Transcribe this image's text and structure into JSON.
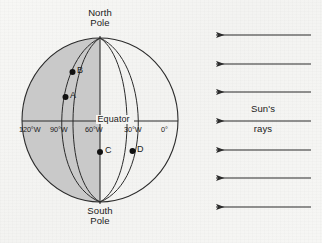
{
  "figure": {
    "type": "earth-day-night-diagram"
  },
  "globe": {
    "poles": {
      "north": {
        "line1": "North",
        "line2": "Pole"
      },
      "south": {
        "line1": "South",
        "line2": "Pole"
      }
    },
    "equator_label": "Equator",
    "shaded_half": "west",
    "shade_color": "#c9c9c9",
    "outline_color": "#2b2b2b",
    "meridians": [
      {
        "label": "120°W",
        "longitude": -120
      },
      {
        "label": "90°W",
        "longitude": -90
      },
      {
        "label": "60°W",
        "longitude": -60
      },
      {
        "label": "30°W",
        "longitude": -30
      },
      {
        "label": "0°",
        "longitude": 0
      }
    ],
    "points": [
      {
        "label": "A",
        "meridian": "90°W",
        "hemisphere": "north"
      },
      {
        "label": "B",
        "meridian": "90°W",
        "hemisphere": "north"
      },
      {
        "label": "C",
        "meridian": "60°W",
        "hemisphere": "south"
      },
      {
        "label": "D",
        "meridian": "30°W",
        "hemisphere": "south"
      }
    ]
  },
  "sun_rays": {
    "label_line1": "Sun's",
    "label_line2": "rays",
    "direction": "right-to-left",
    "arrow_count": 7,
    "color": "#2b2b2b"
  }
}
